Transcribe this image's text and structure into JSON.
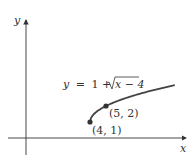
{
  "figure": {
    "axes": {
      "x_label": "x",
      "y_label": "y"
    },
    "equation": {
      "lhs": "y",
      "eq": "=",
      "rhs_const": "1 +",
      "radicand": "x − 4"
    },
    "points": [
      {
        "label": "(4, 1)",
        "x": 4,
        "y": 1
      },
      {
        "label": "(5, 2)",
        "x": 5,
        "y": 2
      }
    ],
    "colors": {
      "curve": "#444444",
      "axis": "#333333",
      "text": "#333333"
    }
  },
  "chart_data": {
    "type": "line",
    "title": "",
    "function": "y = 1 + sqrt(x - 4)",
    "xlabel": "x",
    "ylabel": "y",
    "x": [
      4,
      4.25,
      4.5,
      5,
      6,
      7,
      8,
      9.3
    ],
    "series": [
      {
        "name": "y = 1 + √(x − 4)",
        "values": [
          1,
          1.5,
          1.71,
          2,
          2.41,
          2.73,
          3,
          3.3
        ]
      }
    ],
    "annotations": [
      "(4, 1)",
      "(5, 2)",
      "y = 1 + √(x − 4)"
    ],
    "grid": false,
    "ticks": false
  }
}
